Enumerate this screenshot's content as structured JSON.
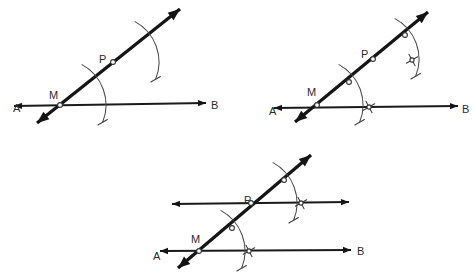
{
  "figure": {
    "title_text": "",
    "type": "geometric-construction",
    "colors": {
      "line": "#1a1a1a",
      "transversal": "#151515",
      "arc": "#4a4a4a",
      "label": "#2b2b2b",
      "background": "#ffffff",
      "node_fill": "#ffffff"
    }
  },
  "panels": [
    {
      "id": "panel-1",
      "step": "1",
      "labels": {
        "A": "A",
        "B": "B",
        "M": "M",
        "P": "P"
      },
      "label_positions": {
        "A": {
          "x": 13,
          "y": 109
        },
        "B": {
          "x": 211,
          "y": 106
        },
        "M": {
          "x": 49,
          "y": 96
        },
        "P": {
          "x": 99,
          "y": 60
        }
      },
      "line_AB": {
        "x1": 14,
        "y1": 106,
        "x2": 206,
        "y2": 103
      },
      "transversal": {
        "x1": 37,
        "y1": 123,
        "x2": 180,
        "y2": 9
      },
      "points": {
        "M": {
          "x": 60,
          "y": 105
        },
        "P": {
          "x": 113,
          "y": 62
        }
      },
      "arcs": [
        {
          "name": "arc-at-M",
          "cx": 60,
          "cy": 105,
          "r": 46,
          "a1": -62,
          "a2": 22
        },
        {
          "name": "arc-at-P",
          "cx": 113,
          "cy": 62,
          "r": 46,
          "a1": -62,
          "a2": 22
        }
      ]
    },
    {
      "id": "panel-2",
      "step": "2",
      "labels": {
        "A": "A",
        "B": "B",
        "M": "M",
        "P": "P"
      },
      "label_positions": {
        "A": {
          "x": 269,
          "y": 112
        },
        "B": {
          "x": 462,
          "y": 110
        },
        "M": {
          "x": 307,
          "y": 93
        },
        "P": {
          "x": 361,
          "y": 55
        }
      },
      "line_AB": {
        "x1": 274,
        "y1": 108,
        "x2": 458,
        "y2": 106
      },
      "transversal": {
        "x1": 295,
        "y1": 122,
        "x2": 428,
        "y2": 12
      },
      "points": {
        "M": {
          "x": 317,
          "y": 105
        },
        "P": {
          "x": 373,
          "y": 59
        }
      },
      "arcs": [
        {
          "name": "arc-at-M",
          "cx": 317,
          "cy": 105,
          "r": 46,
          "a1": -62,
          "a2": 22
        },
        {
          "name": "arc-at-P",
          "cx": 373,
          "cy": 59,
          "r": 46,
          "a1": -62,
          "a2": 22
        }
      ],
      "intersections": [
        {
          "name": "x-mark-on-AB",
          "x": 369,
          "y": 107
        },
        {
          "name": "x-mark-upper",
          "x": 412,
          "y": 60
        },
        {
          "name": "node-lower-arc",
          "x": 349,
          "y": 82
        },
        {
          "name": "node-upper-arc",
          "x": 405,
          "y": 35
        }
      ]
    },
    {
      "id": "panel-3",
      "step": "3",
      "labels": {
        "A": "A",
        "B": "B",
        "M": "M",
        "P": "P"
      },
      "label_positions": {
        "A": {
          "x": 153,
          "y": 257
        },
        "B": {
          "x": 357,
          "y": 252
        },
        "M": {
          "x": 191,
          "y": 240
        },
        "P": {
          "x": 244,
          "y": 201
        }
      },
      "line_AB": {
        "x1": 160,
        "y1": 251,
        "x2": 351,
        "y2": 250
      },
      "line_parallel": {
        "x1": 172,
        "y1": 204,
        "x2": 349,
        "y2": 202
      },
      "transversal": {
        "x1": 178,
        "y1": 268,
        "x2": 311,
        "y2": 155
      },
      "points": {
        "M": {
          "x": 199,
          "y": 251
        },
        "P": {
          "x": 251,
          "y": 203
        }
      },
      "arcs": [
        {
          "name": "arc-at-M",
          "cx": 199,
          "cy": 251,
          "r": 46,
          "a1": -62,
          "a2": 22
        },
        {
          "name": "arc-at-P",
          "cx": 251,
          "cy": 203,
          "r": 46,
          "a1": -62,
          "a2": 22
        }
      ],
      "intersections": [
        {
          "name": "x-mark-on-AB",
          "x": 249,
          "y": 251
        },
        {
          "name": "x-mark-on-parallel",
          "x": 301,
          "y": 203
        },
        {
          "name": "node-lower-arc",
          "x": 232,
          "y": 228
        },
        {
          "name": "node-upper-arc",
          "x": 284,
          "y": 180
        }
      ]
    }
  ]
}
